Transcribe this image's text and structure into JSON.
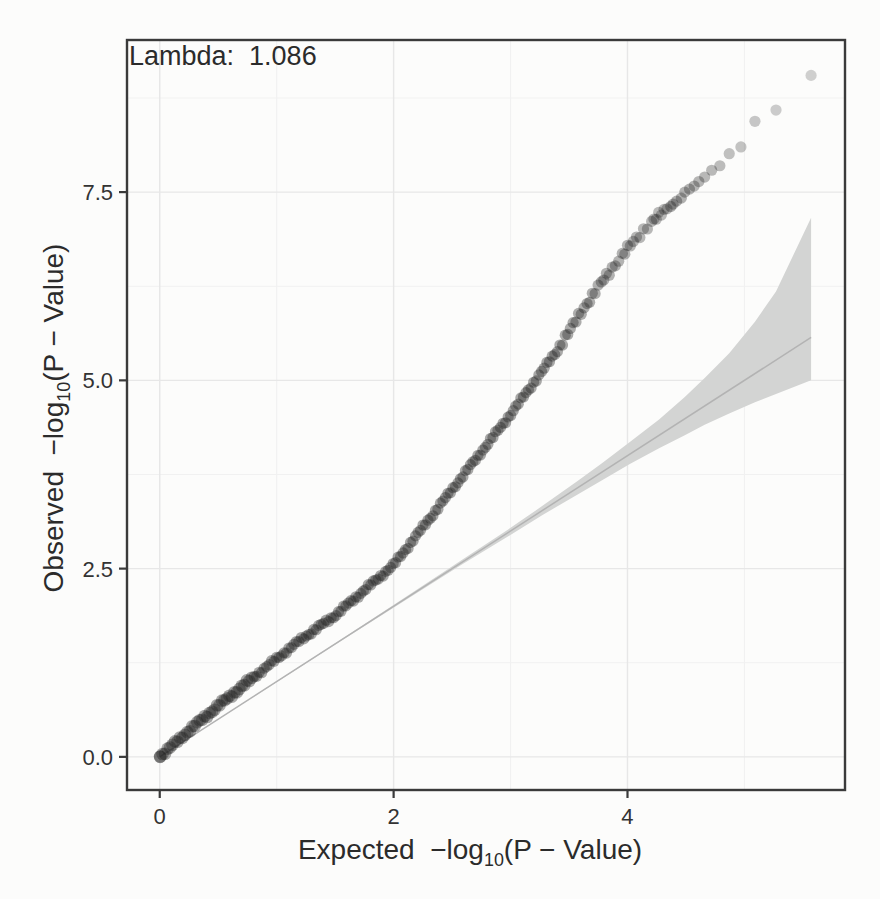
{
  "page": {
    "background": "#fcfcfb"
  },
  "labels": {
    "lambda": "Lambda:  1.086",
    "x_prefix": "Expected  −log",
    "sub10": "10",
    "x_suffix": "(P − Value)",
    "y_prefix": "Observed  −log",
    "y_suffix": "(P − Value)"
  },
  "chart_data": {
    "type": "scatter",
    "subtype": "qq-plot",
    "title": "Lambda: 1.086",
    "lambda": 1.086,
    "xlabel": "Expected −log10(P − Value)",
    "ylabel": "Observed −log10(P − Value)",
    "xlim": [
      -0.28,
      5.86
    ],
    "ylim": [
      -0.44,
      9.52
    ],
    "x_ticks": [
      0,
      2,
      4
    ],
    "x_tick_labels": [
      "0",
      "2",
      "4"
    ],
    "y_ticks": [
      0,
      2.5,
      5,
      7.5
    ],
    "y_tick_labels": [
      "0.0",
      "2.5",
      "5.0",
      "7.5"
    ],
    "x_minor": [
      1,
      3,
      5
    ],
    "y_minor": [
      1.25,
      3.75,
      6.25,
      8.75
    ],
    "grid": "major+minor",
    "legend": "none",
    "n_tests": 370000,
    "diagonal": {
      "from": [
        0,
        0
      ],
      "to": [
        5.57,
        5.57
      ]
    },
    "qq_curve_control_points": [
      [
        0,
        0
      ],
      [
        0.25,
        0.35
      ],
      [
        0.5,
        0.68
      ],
      [
        0.9,
        1.18
      ],
      [
        1.2,
        1.55
      ],
      [
        1.5,
        1.88
      ],
      [
        2.0,
        2.55
      ],
      [
        2.3,
        3.15
      ],
      [
        2.65,
        3.85
      ],
      [
        3.0,
        4.55
      ],
      [
        3.4,
        5.4
      ],
      [
        3.6,
        5.9
      ],
      [
        3.8,
        6.35
      ],
      [
        4.0,
        6.75
      ],
      [
        4.2,
        7.1
      ],
      [
        4.34,
        7.28
      ]
    ],
    "top_points": [
      [
        5.57,
        9.05,
        0.2
      ],
      [
        5.27,
        8.59,
        0.22
      ],
      [
        5.09,
        8.44,
        0.24
      ],
      [
        4.97,
        8.1,
        0.26
      ],
      [
        4.87,
        8.01,
        0.27
      ],
      [
        4.79,
        7.85,
        0.29
      ],
      [
        4.72,
        7.79,
        0.3
      ],
      [
        4.66,
        7.7,
        0.31
      ],
      [
        4.61,
        7.64,
        0.32
      ],
      [
        4.57,
        7.58,
        0.32
      ],
      [
        4.53,
        7.54,
        0.33
      ],
      [
        4.49,
        7.5,
        0.33
      ],
      [
        4.46,
        7.42,
        0.34
      ],
      [
        4.42,
        7.38,
        0.34
      ],
      [
        4.39,
        7.34,
        0.34
      ],
      [
        4.37,
        7.31,
        0.35
      ]
    ],
    "confidence_band": {
      "note": "95% CI funnel around diagonal; points are [expected, lower, upper]",
      "points": [
        [
          0,
          0,
          0
        ],
        [
          0.57,
          0.565,
          0.571
        ],
        [
          1.57,
          1.56,
          1.58
        ],
        [
          2.09,
          2.07,
          2.11
        ],
        [
          2.57,
          2.54,
          2.6
        ],
        [
          2.97,
          2.92,
          3.01
        ],
        [
          3.27,
          3.21,
          3.33
        ],
        [
          3.57,
          3.48,
          3.66
        ],
        [
          3.79,
          3.68,
          3.91
        ],
        [
          4.02,
          3.89,
          4.18
        ],
        [
          4.27,
          4.1,
          4.48
        ],
        [
          4.49,
          4.27,
          4.78
        ],
        [
          4.66,
          4.41,
          5.03
        ],
        [
          4.87,
          4.56,
          5.36
        ],
        [
          5.09,
          4.71,
          5.78
        ],
        [
          5.27,
          4.82,
          6.18
        ],
        [
          5.57,
          5.0,
          7.16
        ]
      ]
    },
    "layout": {
      "panel": {
        "left": 127,
        "top": 40,
        "right": 845,
        "bottom": 790
      },
      "tick_length": 8
    },
    "style": {
      "point_color": "#1f1f1f",
      "dense_opacity": 0.38,
      "point_radius": 5.6,
      "start_radius": 6.3,
      "band_fill": "#d3d4d3",
      "diagonal_color": "#b3b3b3",
      "grid_major": "#e7e7e7",
      "grid_minor": "#f1f1f1",
      "border_color": "#3a3a3a",
      "tick_color": "#3a3a3a",
      "text_color": "#2d2d2d"
    }
  }
}
